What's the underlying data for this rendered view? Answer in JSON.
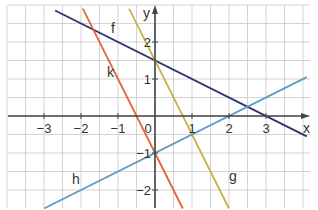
{
  "axes": {
    "x_label": "x",
    "y_label": "y",
    "x_ticks": [
      "−3",
      "−2",
      "−1",
      "0",
      "1",
      "2",
      "3"
    ],
    "y_ticks": [
      "2",
      "1",
      "−1",
      "−2"
    ],
    "origin_label": "0"
  },
  "functions": [
    {
      "name": "f",
      "color": "#2b3270",
      "slope": -0.5,
      "intercept": 1.5
    },
    {
      "name": "g",
      "color": "#c9b24a",
      "slope": -2,
      "intercept": 1.5
    },
    {
      "name": "k",
      "color": "#e0663a",
      "slope": -2,
      "intercept": -1
    },
    {
      "name": "h",
      "color": "#5a9cc8",
      "slope": 0.5,
      "intercept": -1
    }
  ],
  "colors": {
    "grid": "#c8c8c8",
    "axis": "#444444"
  },
  "chart_data": {
    "type": "line",
    "title": "",
    "xlabel": "x",
    "ylabel": "y",
    "xlim": [
      -4,
      4.1
    ],
    "ylim": [
      -2.5,
      3
    ],
    "grid": true,
    "series": [
      {
        "name": "f",
        "equation": "y = -0.5x + 1.5",
        "points": [
          [
            -2.7,
            2.85
          ],
          [
            0,
            1.5
          ],
          [
            3,
            0
          ],
          [
            4.1,
            -0.55
          ]
        ]
      },
      {
        "name": "g",
        "equation": "y = -2x + 1.5",
        "points": [
          [
            -0.7,
            2.9
          ],
          [
            0,
            1.5
          ],
          [
            0.75,
            0
          ],
          [
            2,
            -2.5
          ]
        ]
      },
      {
        "name": "k",
        "equation": "y = -2x - 1",
        "points": [
          [
            -1.95,
            2.9
          ],
          [
            -0.5,
            0
          ],
          [
            0,
            -1
          ],
          [
            0.75,
            -2.5
          ]
        ]
      },
      {
        "name": "h",
        "equation": "y = 0.5x - 1",
        "points": [
          [
            -3,
            -2.5
          ],
          [
            0,
            -1
          ],
          [
            2,
            0
          ],
          [
            4.1,
            1.05
          ]
        ]
      }
    ]
  }
}
